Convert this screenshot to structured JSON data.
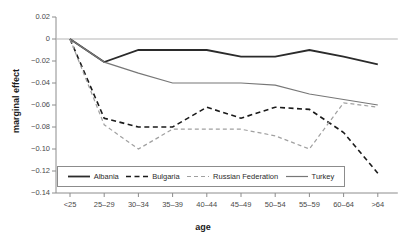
{
  "chart_data": {
    "type": "line",
    "title": "",
    "xlabel": "age",
    "ylabel": "marginal effect",
    "categories": [
      "<25",
      "25–29",
      "30–34",
      "35–39",
      "40–44",
      "45–49",
      "50–54",
      "55–59",
      "60–64",
      ">64"
    ],
    "yticks": [
      0.02,
      0,
      -0.02,
      -0.04,
      -0.06,
      -0.08,
      -0.1,
      -0.12,
      -0.14
    ],
    "ytick_labels": [
      "0.02",
      "0",
      "−0.02",
      "−0.04",
      "−0.06",
      "−0.08",
      "−0.10",
      "−0.12",
      "−0.14"
    ],
    "ylim": [
      -0.14,
      0.02
    ],
    "grid": false,
    "zero_line": true,
    "legend_position": "bottom-inside",
    "series": [
      {
        "name": "Albania",
        "color": "#2b2b2b",
        "style": "solid",
        "width": 1.8,
        "values": [
          0,
          -0.021,
          -0.01,
          -0.01,
          -0.01,
          -0.016,
          -0.016,
          -0.01,
          -0.016,
          -0.023
        ]
      },
      {
        "name": "Bulgaria",
        "color": "#1a1a1a",
        "style": "dashed",
        "width": 1.6,
        "values": [
          0,
          -0.072,
          -0.08,
          -0.08,
          -0.062,
          -0.072,
          -0.062,
          -0.064,
          -0.085,
          -0.122
        ]
      },
      {
        "name": "Russian Federation",
        "color": "#a0a0a0",
        "style": "dashed",
        "width": 1.2,
        "values": [
          0,
          -0.078,
          -0.1,
          -0.082,
          -0.082,
          -0.082,
          -0.088,
          -0.1,
          -0.058,
          -0.062
        ]
      },
      {
        "name": "Turkey",
        "color": "#777777",
        "style": "solid",
        "width": 1.2,
        "values": [
          0,
          -0.021,
          -0.031,
          -0.04,
          -0.04,
          -0.04,
          -0.042,
          -0.05,
          -0.055,
          -0.06
        ]
      }
    ]
  },
  "axes": {
    "y_title": "marginal effect",
    "x_title": "age"
  },
  "legend": {
    "items": [
      {
        "label": "Albania"
      },
      {
        "label": "Bulgaria"
      },
      {
        "label": "Russian Federation"
      },
      {
        "label": "Turkey"
      }
    ]
  }
}
